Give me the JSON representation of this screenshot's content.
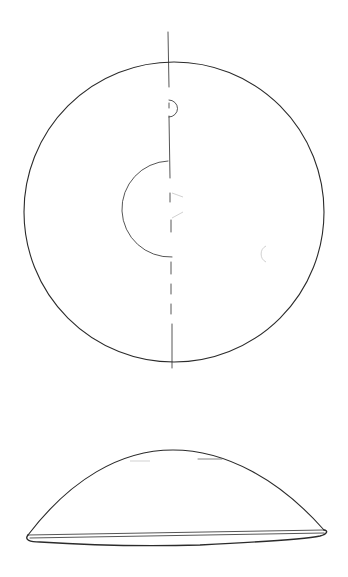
{
  "figure": {
    "line_color": "#2b2b2b",
    "background": "#ffffff"
  },
  "top_view": {
    "outer_circle": {
      "cx": 174,
      "cy": 212,
      "r": 150
    },
    "center_axis": {
      "x": 170,
      "y1": 32,
      "y2": 368,
      "broken_segments": [
        [
          32,
          86
        ],
        [
          115,
          178
        ],
        [
          198,
          232
        ],
        [
          265,
          368
        ]
      ]
    },
    "small_notch": {
      "cx": 170,
      "cy": 110,
      "r": 7
    },
    "inner_semicircle": {
      "cx": 170,
      "cy": 200,
      "r": 50
    },
    "faint_marks": [
      {
        "type": "arc",
        "cx": 262,
        "cy": 255,
        "r": 8
      },
      {
        "type": "dash",
        "x1": 172,
        "y1": 192,
        "x2": 183,
        "y2": 197
      }
    ]
  },
  "side_view": {
    "dome_apex": {
      "x": 173,
      "y": 450
    },
    "left_edge": {
      "x": 26,
      "y": 537
    },
    "right_edge": {
      "x": 326,
      "y": 530
    },
    "base_thickness": 8
  }
}
